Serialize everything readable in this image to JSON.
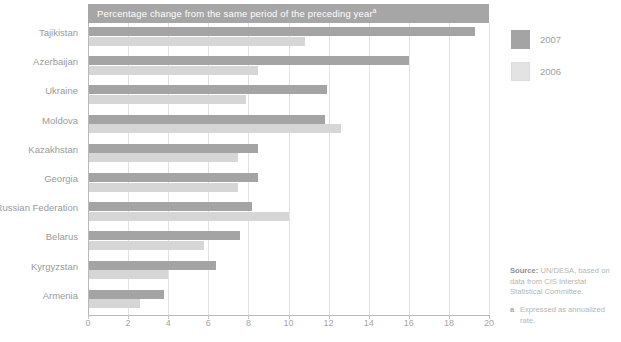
{
  "chart_data": {
    "type": "bar",
    "orientation": "horizontal",
    "title": "Percentage change from the same period of the preceding year",
    "title_superscript": "a",
    "xlabel": "",
    "ylabel": "",
    "xlim": [
      0,
      20
    ],
    "xticks": [
      0,
      2,
      4,
      6,
      8,
      10,
      12,
      14,
      16,
      18,
      20
    ],
    "grid": true,
    "legend_position": "right",
    "categories": [
      "Tajikistan",
      "Azerbaijan",
      "Ukraine",
      "Moldova",
      "Kazakhstan",
      "Georgia",
      "Russian Federation",
      "Belarus",
      "Kyrgyzstan",
      "Armenia"
    ],
    "series": [
      {
        "name": "2007",
        "color": "#a4a4a4",
        "values": [
          19.3,
          16.0,
          11.9,
          11.8,
          8.5,
          8.5,
          8.2,
          7.6,
          6.4,
          3.8
        ]
      },
      {
        "name": "2006",
        "color": "#d6d6d6",
        "values": [
          10.8,
          8.5,
          7.9,
          12.6,
          7.5,
          7.5,
          10.0,
          5.8,
          4.0,
          2.6
        ]
      }
    ]
  },
  "legend": {
    "items": [
      {
        "label": "2007"
      },
      {
        "label": "2006"
      }
    ]
  },
  "notes": {
    "source_label": "Source:",
    "source_text": " UN/DESA, based on data from CIS Interstat Statistical Committee.",
    "footnote_marker": "a",
    "footnote_text": "Expressed as annualized rate."
  }
}
